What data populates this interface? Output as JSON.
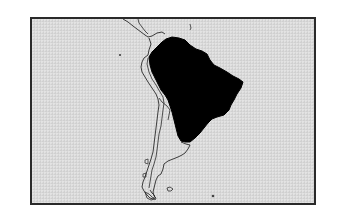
{
  "map": {
    "region": "South America",
    "highlighted_region": "Brazil",
    "colors": {
      "background": "#ffffff",
      "ocean": "#d9d9d9",
      "frame": "#2a2a2a",
      "coastline": "#2a2a2a",
      "highlight_fill": "#000000",
      "land_fill": "#dcdcdc"
    },
    "features": [
      {
        "name": "coastline-outline",
        "type": "line"
      },
      {
        "name": "country-borders",
        "type": "line"
      },
      {
        "name": "highlighted-country",
        "type": "filled-polygon"
      },
      {
        "name": "falkland-islands",
        "type": "island"
      },
      {
        "name": "south-georgia",
        "type": "island"
      },
      {
        "name": "galapagos",
        "type": "island"
      }
    ]
  }
}
